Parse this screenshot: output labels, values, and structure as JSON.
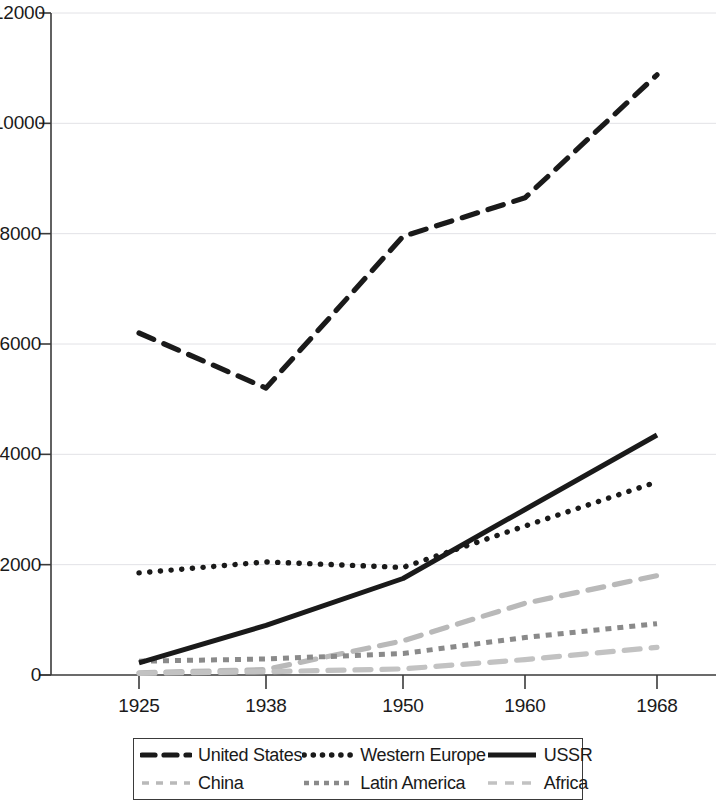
{
  "chart_data": {
    "type": "line",
    "title": "",
    "subtitle": "",
    "xlabel": "",
    "ylabel": "",
    "x": [
      1925,
      1938,
      1950,
      1960,
      1968
    ],
    "categories": [
      "1925",
      "1938",
      "1950",
      "1960",
      "1968"
    ],
    "xtick_labels": [
      "1925",
      "1938",
      "1950",
      "1960",
      "1968"
    ],
    "ytick_labels": [
      "0",
      "2000",
      "4000",
      "6000",
      "8000",
      "10000",
      "12000"
    ],
    "ytick_values": [
      0,
      2000,
      4000,
      6000,
      8000,
      10000,
      12000
    ],
    "ylim": [
      0,
      12000
    ],
    "xlim": [
      1925,
      1968
    ],
    "grid": "horizontal",
    "legend_position": "bottom",
    "series": [
      {
        "name": "United States",
        "values": [
          6200,
          5200,
          7950,
          8650,
          10880
        ],
        "color": "#1a1a1a",
        "style": "dashed"
      },
      {
        "name": "Western Europe",
        "values": [
          1850,
          2050,
          1950,
          2700,
          3500
        ],
        "color": "#1a1a1a",
        "style": "dotted"
      },
      {
        "name": "USSR",
        "values": [
          220,
          900,
          1750,
          3000,
          4350
        ],
        "color": "#1a1a1a",
        "style": "solid"
      },
      {
        "name": "China",
        "values": [
          40,
          100,
          620,
          1300,
          1800
        ],
        "color": "#b9b9b9",
        "style": "dashed"
      },
      {
        "name": "Latin America",
        "values": [
          250,
          290,
          390,
          680,
          930
        ],
        "color": "#8a8a8a",
        "style": "square-dotted"
      },
      {
        "name": "Africa",
        "values": [
          30,
          60,
          110,
          280,
          500
        ],
        "color": "#c2c2c2",
        "style": "dashed"
      }
    ]
  },
  "legend": {
    "entries": [
      {
        "label": "United States",
        "swatch": "dash-black"
      },
      {
        "label": "Western Europe",
        "swatch": "dot-black"
      },
      {
        "label": "USSR",
        "swatch": "solid-black"
      },
      {
        "label": "China",
        "swatch": "dash-light"
      },
      {
        "label": "Latin America",
        "swatch": "dot-gray"
      },
      {
        "label": "Africa",
        "swatch": "dash-light2"
      }
    ]
  },
  "axes": {
    "y_top_pixel": 13,
    "y_zero_pixel": 675,
    "x_positions": [
      139,
      266,
      403,
      525,
      657
    ]
  }
}
